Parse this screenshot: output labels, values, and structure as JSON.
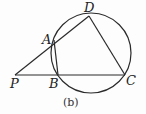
{
  "diagram": {
    "caption": "(b)",
    "stroke_color": "#2a2a2a",
    "circle": {
      "cx": 91,
      "cy": 53,
      "r": 40
    },
    "points": {
      "P": {
        "label": "P",
        "x": 15,
        "y": 75
      },
      "A": {
        "label": "A",
        "x": 54,
        "y": 40
      },
      "B": {
        "label": "B",
        "x": 58,
        "y": 75
      },
      "C": {
        "label": "C",
        "x": 125,
        "y": 75
      },
      "D": {
        "label": "D",
        "x": 89,
        "y": 16
      }
    },
    "segments": [
      [
        "P",
        "D"
      ],
      [
        "P",
        "C"
      ],
      [
        "A",
        "B"
      ],
      [
        "D",
        "C"
      ]
    ]
  }
}
